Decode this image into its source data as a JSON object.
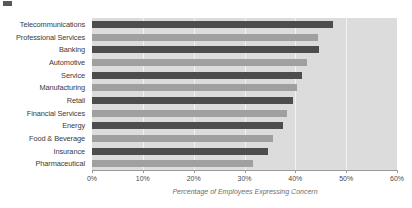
{
  "chart_data": {
    "type": "bar",
    "orientation": "horizontal",
    "title": "",
    "xlabel": "Percentage of Employees Expressing Concern",
    "ylabel": "",
    "xlim": [
      0,
      60
    ],
    "xtick_labels": [
      "0%",
      "10%",
      "20%",
      "30%",
      "40%",
      "50%",
      "60%"
    ],
    "xticks": [
      0,
      10,
      20,
      30,
      40,
      50,
      60
    ],
    "grid": true,
    "legend": "none",
    "categories": [
      "Telecommunications",
      "Professional Services",
      "Banking",
      "Automotive",
      "Service",
      "Manufacturing",
      "Retail",
      "Financial Services",
      "Energy",
      "Food & Beverage",
      "Insurance",
      "Pharmaceutical"
    ],
    "values": [
      47.5,
      44.5,
      44.6,
      42.3,
      41.4,
      40.3,
      39.5,
      38.4,
      37.5,
      35.7,
      34.6,
      31.6
    ],
    "bar_colors": [
      "#4d4d4d",
      "#a0a0a0",
      "#4d4d4d",
      "#a0a0a0",
      "#4d4d4d",
      "#a0a0a0",
      "#4d4d4d",
      "#a0a0a0",
      "#4d4d4d",
      "#a0a0a0",
      "#4d4d4d",
      "#a0a0a0"
    ],
    "plot_background": "#dcdcdc",
    "gridline_color": "#f2f2f2",
    "axis_color": "#9a9a9a"
  }
}
